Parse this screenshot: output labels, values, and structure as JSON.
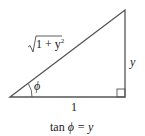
{
  "diagram": {
    "type": "right-triangle",
    "hypotenuse_label": "√1 + y²",
    "hypotenuse_radicand": "1 + y",
    "hypotenuse_exponent": "2",
    "vertical_side_label": "y",
    "horizontal_side_label": "1",
    "angle_label": "ϕ",
    "caption_prefix": "tan",
    "caption_angle": "ϕ",
    "caption_suffix": "= y",
    "line_color": "#555555"
  }
}
